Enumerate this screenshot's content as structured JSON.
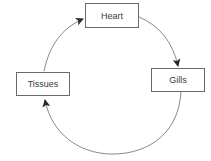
{
  "diagram": {
    "type": "cycle",
    "nodes": [
      {
        "id": "heart",
        "label": "Heart"
      },
      {
        "id": "gills",
        "label": "Gills"
      },
      {
        "id": "tissues",
        "label": "Tissues"
      }
    ],
    "edges": [
      {
        "from": "heart",
        "to": "gills"
      },
      {
        "from": "gills",
        "to": "tissues"
      },
      {
        "from": "tissues",
        "to": "heart"
      }
    ],
    "colors": {
      "line": "#6a6a6a",
      "arrowhead": "#2a2a2a",
      "box_border": "#6a6a6a",
      "text": "#3a3a3a",
      "background": "#ffffff"
    }
  }
}
